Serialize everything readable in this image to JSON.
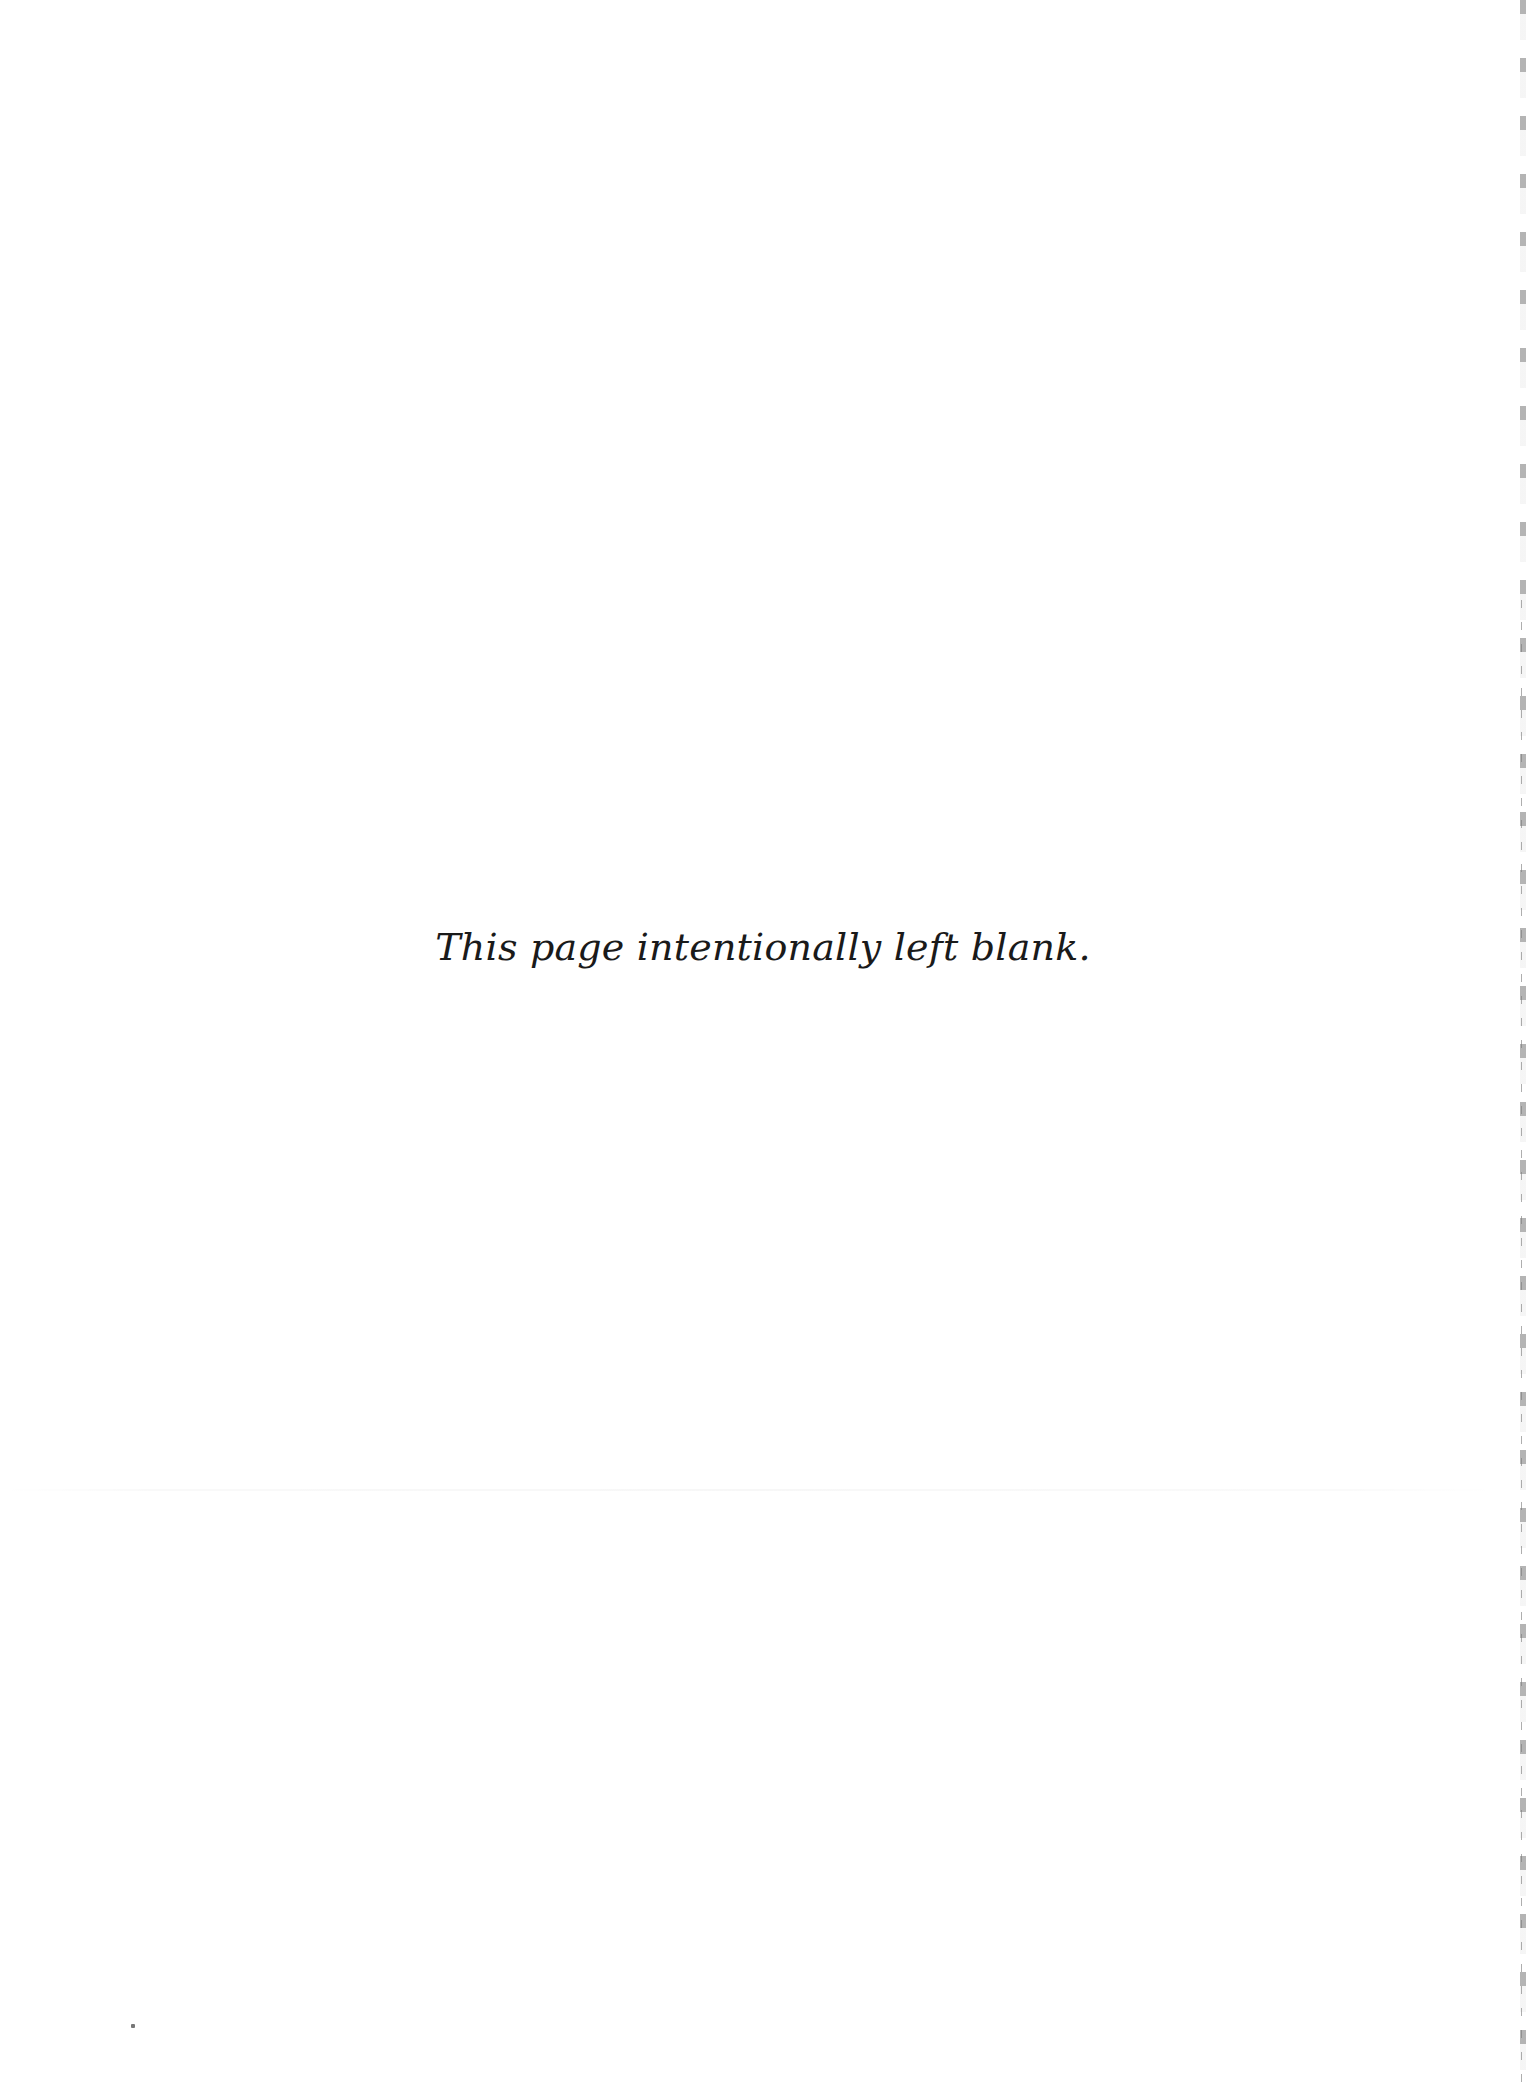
{
  "page": {
    "notice_text": "This page intentionally left blank.",
    "background_color": "#ffffff",
    "text_color": "#1a1a1a"
  }
}
